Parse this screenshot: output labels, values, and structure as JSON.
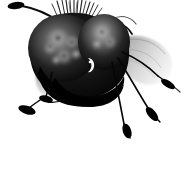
{
  "image": {
    "subject": "fly-insect-frontal-view",
    "style": "monochrome-ink-illustration",
    "width": 184,
    "height": 182,
    "background_color": "#ffffff",
    "ink_color": "#000000",
    "alt_text": "Monochrome illustration of a fly seen head-on with two large mottled compound eyes, a bristle crest, clubbed antennae, translucent wings and thin legs"
  },
  "palette": {
    "background": "#ffffff",
    "body_black": "#050505",
    "body_dark": "#141414",
    "eye_mid": "#2e2e2e",
    "eye_light": "#8e8e8e",
    "eye_highlight": "#cfcfcf",
    "wing_gray": "#9a9a9a",
    "wing_light": "#c8c8c8",
    "vein_gray": "#6a6a6a",
    "leg_black": "#0a0a0a",
    "foot_black": "#000000",
    "bristle_gray": "#3a3a3a",
    "ocellus_highlight": "#f2f2f2"
  },
  "parts": [
    {
      "id": "head-capsule",
      "label": "Head capsule"
    },
    {
      "id": "left-compound-eye",
      "label": "Left compound eye"
    },
    {
      "id": "right-compound-eye",
      "label": "Right compound eye"
    },
    {
      "id": "eye-mottling-left",
      "label": "Left eye mottled facets"
    },
    {
      "id": "eye-mottling-right",
      "label": "Right eye highlight"
    },
    {
      "id": "bristle-crest",
      "label": "Dorsal bristle crest"
    },
    {
      "id": "antenna-left",
      "label": "Left clubbed antenna"
    },
    {
      "id": "antenna-right",
      "label": "Right antenna"
    },
    {
      "id": "ocellus-highlight",
      "label": "Bright crescent highlight on face"
    },
    {
      "id": "thorax-mass",
      "label": "Dark thorax mass"
    },
    {
      "id": "wing-right",
      "label": "Right translucent wing"
    },
    {
      "id": "wing-left",
      "label": "Left translucent wing"
    },
    {
      "id": "leg-front-left",
      "label": "Front left leg"
    },
    {
      "id": "leg-mid-left",
      "label": "Middle left leg"
    },
    {
      "id": "leg-front-right",
      "label": "Front right leg"
    },
    {
      "id": "leg-mid-right",
      "label": "Middle right leg"
    },
    {
      "id": "leg-hind-right",
      "label": "Hind right leg"
    },
    {
      "id": "tarsus-pads",
      "label": "Dark tarsal foot pads"
    }
  ]
}
